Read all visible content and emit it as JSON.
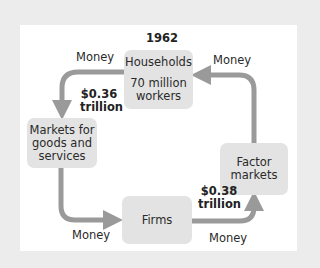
{
  "diagram": {
    "title": "1962",
    "nodes": {
      "households": {
        "line1": "Households",
        "line2": "70 million",
        "line3": "workers"
      },
      "markets_goods": {
        "line1": "Markets for",
        "line2": "goods and",
        "line3": "services"
      },
      "firms": {
        "label": "Firms"
      },
      "factor_markets": {
        "line1": "Factor",
        "line2": "markets"
      }
    },
    "flows": {
      "households_to_goods": {
        "label": "Money",
        "amount_line1": "$0.36",
        "amount_line2": "trillion"
      },
      "goods_to_firms": {
        "label": "Money"
      },
      "firms_to_factor": {
        "label": "Money",
        "amount_line1": "$0.38",
        "amount_line2": "trillion"
      },
      "factor_to_households": {
        "label": "Money"
      }
    },
    "colors": {
      "background": "#ececec",
      "panel": "#ffffff",
      "box": "#e3e3e3",
      "arrow": "#9a9a9a"
    }
  }
}
